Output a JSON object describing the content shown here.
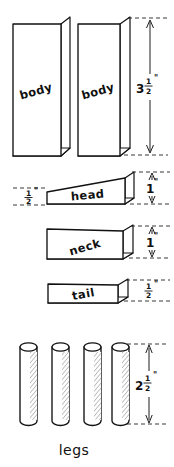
{
  "drawing": {
    "title": "Parts Cutting Diagram",
    "units": "inches",
    "background_color": "#ffffff",
    "ink_color": "#111111",
    "style": "hand-drawn pencil sketch"
  },
  "parts": [
    {
      "id": "body-left",
      "label": "body",
      "shape": "rectangular-block",
      "quantity_shown": 1,
      "dimension_shown": null
    },
    {
      "id": "body-right",
      "label": "body",
      "shape": "rectangular-block",
      "quantity_shown": 1,
      "dimension_shown": "3 1/2 in"
    },
    {
      "id": "head",
      "label": "head",
      "shape": "wedge-block",
      "quantity_shown": 1,
      "dimension_shown": "1 in"
    },
    {
      "id": "neck",
      "label": "neck",
      "shape": "rectangular-block",
      "quantity_shown": 1,
      "dimension_shown": "1 in"
    },
    {
      "id": "tail",
      "label": "tail",
      "shape": "rectangular-block",
      "quantity_shown": 1,
      "dimension_shown": "1/2 in"
    },
    {
      "id": "legs",
      "label": "legs",
      "shape": "cylinder-dowel",
      "quantity_shown": 4,
      "dimension_shown": "2 1/2 in"
    }
  ],
  "dimensions": {
    "body_height": {
      "whole": "3",
      "numerator": "1",
      "denominator": "2",
      "unit_mark": "\"",
      "text": "3 1/2\"",
      "applies_to": "body-right"
    },
    "head_height": {
      "whole": "1",
      "numerator": "",
      "denominator": "",
      "unit_mark": "\"",
      "text": "1\"",
      "applies_to": "head"
    },
    "head_thin_end": {
      "whole": "",
      "numerator": "1",
      "denominator": "2",
      "unit_mark": "\"",
      "text": "1/2\"",
      "applies_to": "head"
    },
    "neck_height": {
      "whole": "1",
      "numerator": "",
      "denominator": "",
      "unit_mark": "\"",
      "text": "1\"",
      "applies_to": "neck"
    },
    "tail_height": {
      "whole": "",
      "numerator": "1",
      "denominator": "2",
      "unit_mark": "\"",
      "text": "1/2\"",
      "applies_to": "tail"
    },
    "leg_length": {
      "whole": "2",
      "numerator": "1",
      "denominator": "2",
      "unit_mark": "\"",
      "text": "2 1/2\"",
      "applies_to": "legs"
    }
  },
  "captions": {
    "legs_caption": "legs"
  }
}
